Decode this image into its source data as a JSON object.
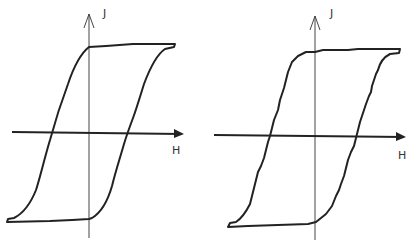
{
  "diagram": {
    "type": "hysteresis-loops",
    "panels": [
      {
        "id": "left",
        "y_axis_label": "J",
        "x_axis_label": "H",
        "description": "Smooth hysteresis loop (J vs H)"
      },
      {
        "id": "right",
        "y_axis_label": "J",
        "x_axis_label": "H",
        "description": "Stepped (Barkhausen) hysteresis loop (J vs H)"
      }
    ],
    "colors": {
      "line": "#222222",
      "axis": "#333333",
      "background": "#ffffff"
    }
  }
}
